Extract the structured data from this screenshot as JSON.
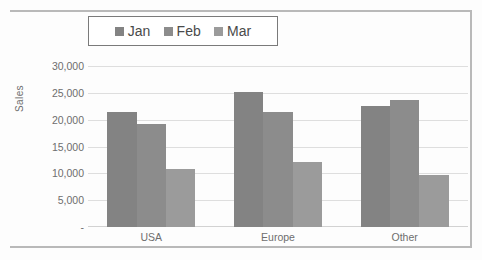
{
  "chart_data": {
    "type": "bar",
    "title": "",
    "subtitle": "",
    "xlabel": "",
    "ylabel": "Sales",
    "categories": [
      "USA",
      "Europe",
      "Other"
    ],
    "series": [
      {
        "name": "Jan",
        "values": [
          21500,
          25200,
          22500
        ],
        "color": "#838383"
      },
      {
        "name": "Feb",
        "values": [
          19200,
          21400,
          23700
        ],
        "color": "#8c8c8c"
      },
      {
        "name": "Mar",
        "values": [
          10800,
          12200,
          9700
        ],
        "color": "#9b9b9b"
      }
    ],
    "series_by_category": {
      "USA": {
        "Jan": 21500,
        "Feb": 25200,
        "Mar": 22500
      },
      "Europe": {
        "Jan": 19200,
        "Feb": 21400,
        "Mar": 23700
      },
      "Other": {
        "Jan": 10800,
        "Feb": 12200,
        "Mar": 9700
      }
    },
    "ylim": [
      0,
      30000
    ],
    "ytick_values": [
      0,
      5000,
      10000,
      15000,
      20000,
      25000,
      30000
    ],
    "ytick_labels": [
      "-",
      "5,000",
      "10,000",
      "15,000",
      "20,000",
      "25,000",
      "30,000"
    ],
    "grid": true,
    "grid_axis": "y",
    "legend_position": "top-center",
    "legend_entries": [
      "Jan",
      "Feb",
      "Mar"
    ],
    "annotations": []
  },
  "legend": {
    "items": [
      {
        "label": "Jan",
        "swatch_color": "#838383"
      },
      {
        "label": "Feb",
        "swatch_color": "#8c8c8c"
      },
      {
        "label": "Mar",
        "swatch_color": "#9b9b9b"
      }
    ]
  },
  "axes": {
    "y_title": "Sales"
  },
  "colors": {
    "grid": "#dedede",
    "frame": "#b9b9b9",
    "text": "#6e6e6e",
    "legend_border": "#7a7a7a",
    "background": "#fdfdfd"
  }
}
